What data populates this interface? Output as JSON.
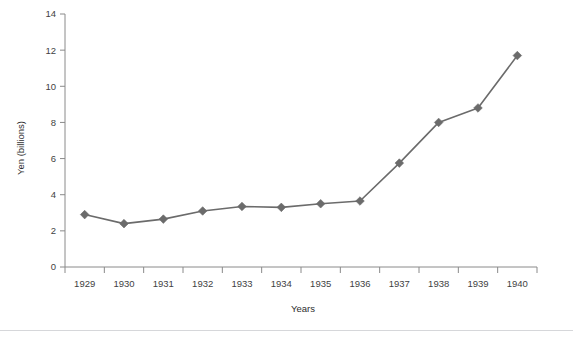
{
  "figure": {
    "top_caption_remnant": "",
    "background_color": "#ffffff",
    "divider_color": "#d6d7da"
  },
  "chart_data": {
    "type": "line",
    "title": "",
    "xlabel": "Years",
    "ylabel": "Yen (billions)",
    "categories": [
      "1929",
      "1930",
      "1931",
      "1932",
      "1933",
      "1934",
      "1935",
      "1936",
      "1937",
      "1938",
      "1939",
      "1940"
    ],
    "values": [
      2.9,
      2.4,
      2.65,
      3.1,
      3.35,
      3.3,
      3.5,
      3.65,
      5.75,
      8.0,
      8.8,
      11.7
    ],
    "series": [
      {
        "name": "Yen (billions)",
        "values": [
          2.9,
          2.4,
          2.65,
          3.1,
          3.35,
          3.3,
          3.5,
          3.65,
          5.75,
          8.0,
          8.8,
          11.7
        ]
      }
    ],
    "ylim": [
      0,
      14
    ],
    "yticks": [
      0,
      2,
      4,
      6,
      8,
      10,
      12,
      14
    ],
    "ytick_labels": [
      "0",
      "2",
      "4",
      "6",
      "8",
      "10",
      "12",
      "14"
    ],
    "xtick_labels": [
      "1929",
      "1930",
      "1931",
      "1932",
      "1933",
      "1934",
      "1935",
      "1936",
      "1937",
      "1938",
      "1939",
      "1940"
    ],
    "grid": false,
    "legend": false,
    "legend_position": "none",
    "line_color": "#6b6b6b",
    "marker": "diamond",
    "marker_color": "#6b6b6b",
    "axis_color": "#8a8a8a"
  }
}
